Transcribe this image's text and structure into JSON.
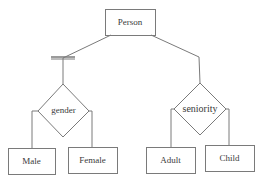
{
  "diagram": {
    "type": "EER specialization diagram",
    "superclass": {
      "label": "Person",
      "box": [
        105,
        9,
        50,
        26
      ]
    },
    "specializations": [
      {
        "label": "gender",
        "constraint": "total (double bar)",
        "diamond_center": [
          63,
          111
        ],
        "subclasses": [
          {
            "label": "Male",
            "box": [
              8,
              148,
              47,
              26
            ]
          },
          {
            "label": "Female",
            "box": [
              68,
              147,
              49,
              26
            ]
          }
        ]
      },
      {
        "label": "seniority",
        "constraint": "partial",
        "diamond_center": [
          200,
          109
        ],
        "subclasses": [
          {
            "label": "Adult",
            "box": [
              146,
              147,
              49,
              26
            ]
          },
          {
            "label": "Child",
            "box": [
              205,
              145,
              49,
              26
            ]
          }
        ]
      }
    ],
    "colors": {
      "line": "#7a7a7a",
      "text": "#3a3a3a",
      "background": "#ffffff"
    }
  }
}
